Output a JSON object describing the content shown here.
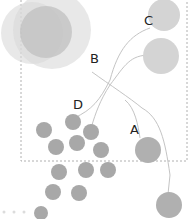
{
  "labels": {
    "a": "A",
    "b": "B",
    "c": "C",
    "d": "D"
  },
  "colors": {
    "large_circle": "#d4d4d4",
    "cluster_circle": "#a6a6a6",
    "line": "#bdbdbd",
    "dashed_border": "#aaaaaa"
  },
  "dots_count": 3
}
